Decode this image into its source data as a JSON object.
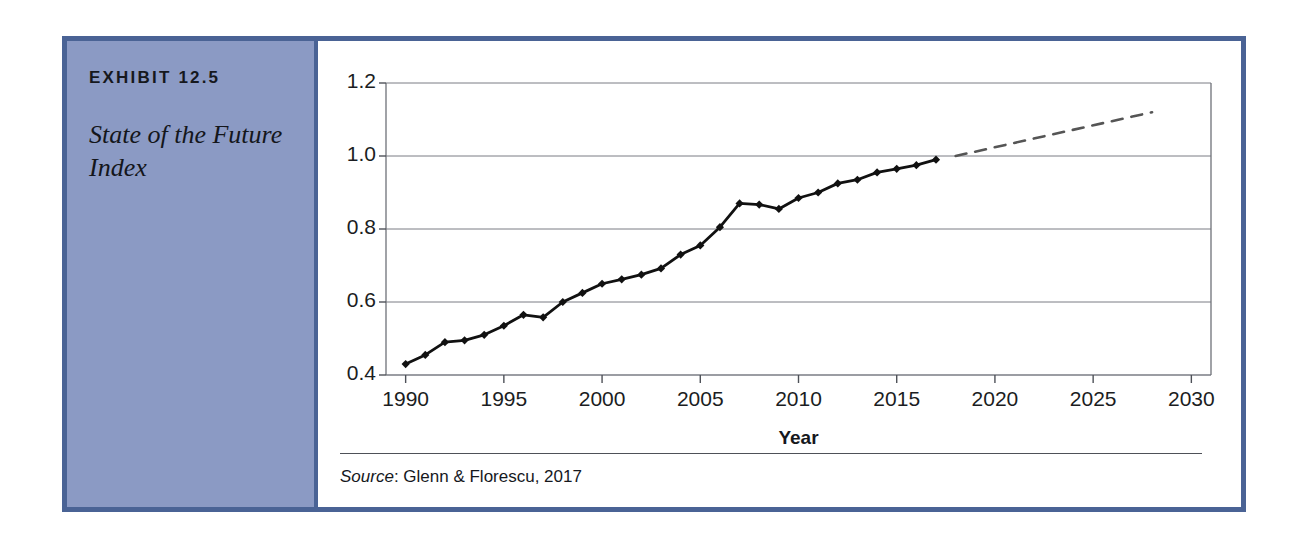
{
  "exhibit": {
    "number_label": "EXHIBIT 12.5",
    "title": "State of the Future Index",
    "frame_color": "#4a6395",
    "sidebar_color": "#8b9ac4"
  },
  "source": {
    "prefix": "Source",
    "separator": ": ",
    "text": "Glenn & Florescu, 2017",
    "full": "Source: Glenn & Florescu, 2017"
  },
  "chart_data": {
    "type": "line",
    "title": "State of the Future Index",
    "xlabel": "Year",
    "ylabel": "",
    "xlim": [
      1989,
      2031
    ],
    "ylim": [
      0.4,
      1.2
    ],
    "xticks": [
      1990,
      1995,
      2000,
      2005,
      2010,
      2015,
      2020,
      2025,
      2030
    ],
    "yticks": [
      0.4,
      0.6,
      0.8,
      1.0,
      1.2
    ],
    "ytick_labels": [
      "0.4",
      "0.6",
      "0.8",
      "1.0",
      "1.2"
    ],
    "xtick_labels": [
      "1990",
      "1995",
      "2000",
      "2005",
      "2010",
      "2015",
      "2020",
      "2025",
      "2030"
    ],
    "grid": "horizontal",
    "legend": "none",
    "series": [
      {
        "name": "State of the Future Index (historical)",
        "style": "solid",
        "marker": "diamond",
        "color": "#111111",
        "x": [
          1990,
          1991,
          1992,
          1993,
          1994,
          1995,
          1996,
          1997,
          1998,
          1999,
          2000,
          2001,
          2002,
          2003,
          2004,
          2005,
          2006,
          2007,
          2008,
          2009,
          2010,
          2011,
          2012,
          2013,
          2014,
          2015,
          2016,
          2017
        ],
        "y": [
          0.43,
          0.455,
          0.49,
          0.495,
          0.51,
          0.535,
          0.565,
          0.558,
          0.6,
          0.625,
          0.65,
          0.662,
          0.675,
          0.692,
          0.73,
          0.755,
          0.805,
          0.87,
          0.867,
          0.855,
          0.885,
          0.9,
          0.925,
          0.935,
          0.955,
          0.965,
          0.975,
          0.99
        ]
      },
      {
        "name": "Projection",
        "style": "dashed",
        "marker": "none",
        "color": "#555555",
        "x": [
          2018,
          2028
        ],
        "y": [
          1.0,
          1.12
        ]
      }
    ]
  }
}
